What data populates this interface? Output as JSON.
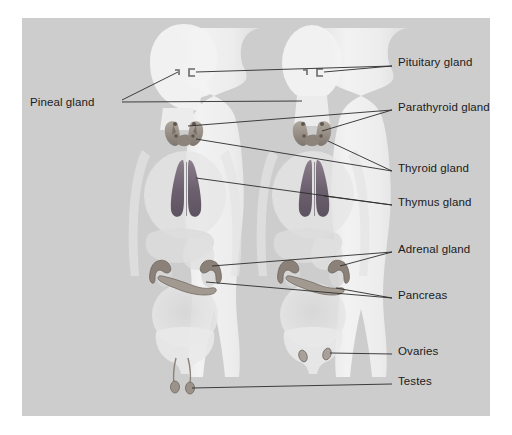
{
  "figure": {
    "panel_color": "#cdcdcd",
    "page_color": "#ffffff",
    "text_color": "#1b1b1b",
    "leader_color": "#2b2b2b",
    "body_fill": "#efefef",
    "organ_dark": "#6f6470",
    "organ_mid": "#9a9298",
    "organ_light": "#c9c4c2"
  },
  "labels": {
    "pineal": "Pineal gland",
    "pituitary": "Pituitary gland",
    "parathyroid": "Parathyroid gland",
    "thyroid": "Thyroid gland",
    "thymus": "Thymus gland",
    "adrenal": "Adrenal gland",
    "pancreas": "Pancreas",
    "ovaries": "Ovaries",
    "testes": "Testes"
  },
  "label_positions": {
    "pineal": {
      "x": 30,
      "y": 102
    },
    "pituitary": {
      "x": 398,
      "y": 62
    },
    "parathyroid": {
      "x": 398,
      "y": 107
    },
    "thyroid": {
      "x": 398,
      "y": 168
    },
    "thymus": {
      "x": 398,
      "y": 202
    },
    "adrenal": {
      "x": 398,
      "y": 249
    },
    "pancreas": {
      "x": 398,
      "y": 295
    },
    "ovaries": {
      "x": 398,
      "y": 351
    },
    "testes": {
      "x": 398,
      "y": 381
    }
  },
  "figures": [
    {
      "name": "left-figure-male",
      "view": "profile-head",
      "gonad": "testes"
    },
    {
      "name": "right-figure-female",
      "view": "frontal-head",
      "gonad": "ovaries"
    }
  ],
  "glands": [
    "pineal gland",
    "pituitary gland",
    "parathyroid gland",
    "thyroid gland",
    "thymus gland",
    "adrenal gland",
    "pancreas",
    "ovaries",
    "testes"
  ]
}
